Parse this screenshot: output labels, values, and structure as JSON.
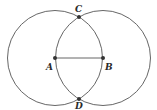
{
  "diagram": {
    "stroke_color": "#555555",
    "point_color": "#333333",
    "circles": [
      {
        "name": "circle-A",
        "center": "A",
        "cx": 55,
        "cy": 58,
        "r": 47.5
      },
      {
        "name": "circle-B",
        "center": "B",
        "cx": 103,
        "cy": 58,
        "r": 47.5
      }
    ],
    "segments": [
      {
        "name": "segment-AB",
        "from": "A",
        "to": "B"
      }
    ],
    "points": {
      "A": {
        "label": "A",
        "x": 55,
        "y": 58,
        "lx": 46,
        "ly": 70
      },
      "B": {
        "label": "B",
        "x": 103,
        "y": 58,
        "lx": 105,
        "ly": 70
      },
      "C": {
        "label": "C",
        "x": 79,
        "y": 17,
        "lx": 75,
        "ly": 12
      },
      "D": {
        "label": "D",
        "x": 79,
        "y": 99,
        "lx": 75,
        "ly": 109
      }
    }
  }
}
